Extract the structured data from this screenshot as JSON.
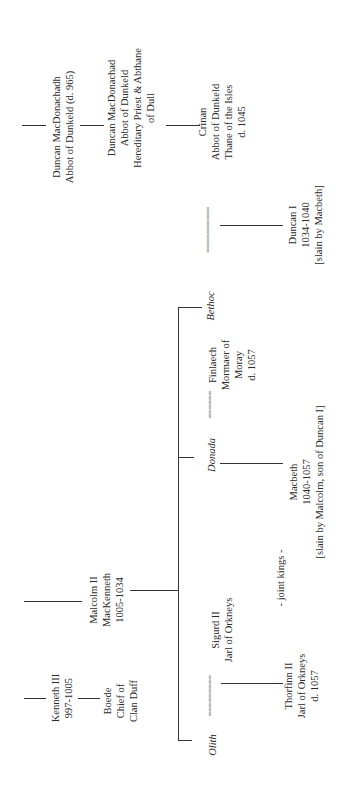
{
  "tree": {
    "duncan_macdonachadh": {
      "lines": [
        "Duncan MacDonachadh",
        "Abbot of Dunkeld (d. 965)"
      ]
    },
    "duncan_macdonachad": {
      "lines": [
        "Duncan MacDonachad",
        "Abbot of Dunkeld",
        "Hereditary Priest & Abthane",
        "of Dull"
      ]
    },
    "crinan": {
      "lines": [
        "Crinan",
        "Abbot of Dunkeld",
        "Thane of the Isles",
        "d. 1045"
      ]
    },
    "bethoc": {
      "name": "Bethoc"
    },
    "duncan_i": {
      "lines": [
        "Duncan I",
        "1034-1040",
        "[slain by Macbeth]"
      ]
    },
    "donada": {
      "name": "Donada"
    },
    "finlaech": {
      "lines": [
        "Finlaech",
        "Mormaer of",
        "Moray",
        "d. 1057"
      ]
    },
    "macbeth": {
      "lines": [
        "Macbeth",
        "1040-1057",
        "[slain by Malcolm, son of Duncan I]"
      ]
    },
    "joint_kings": {
      "text": "- joint kings -"
    },
    "malcolm_ii": {
      "lines": [
        "Malcolm II",
        "MacKenneth",
        "1005-1034"
      ]
    },
    "olith": {
      "name": "Olith"
    },
    "sigurd_ii": {
      "lines": [
        "Sigurd II",
        "Jarl of Orkneys"
      ]
    },
    "thorfinn_ii": {
      "lines": [
        "Thorfinn II",
        "Jarl of Orkneys",
        "d. 1057"
      ]
    },
    "kenneth_iii": {
      "lines": [
        "Kenneth III",
        "997-1005"
      ]
    },
    "boede": {
      "lines": [
        "Boede",
        "Chief of",
        "Clan Duff"
      ]
    },
    "marriage_symbol_long": "==========",
    "marriage_symbol_mid": "======",
    "marriage_symbol_short": "========="
  }
}
